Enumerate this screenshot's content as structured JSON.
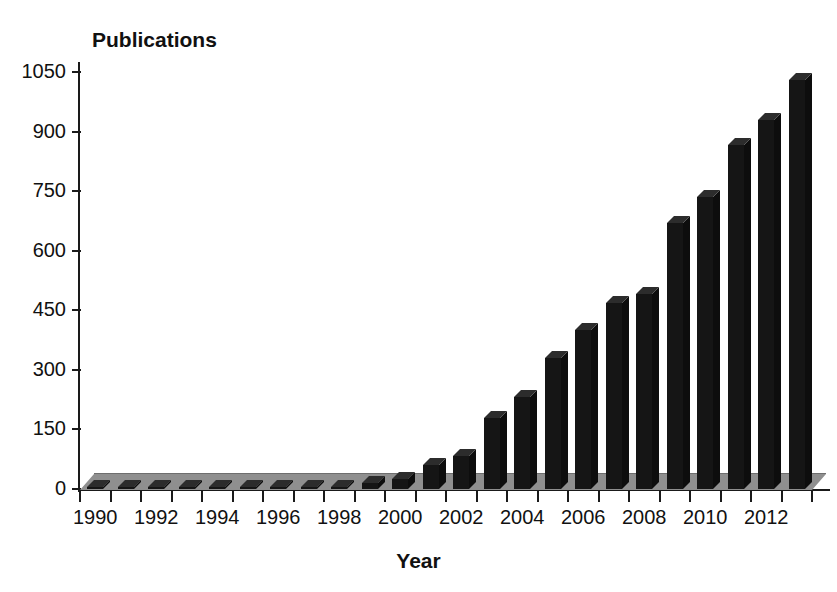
{
  "chart_data": {
    "type": "bar",
    "title": "",
    "xlabel": "Year",
    "ylabel": "Publications",
    "ylim": [
      0,
      1100
    ],
    "yticks": [
      0,
      150,
      300,
      450,
      600,
      750,
      900,
      1050
    ],
    "xtick_labels": [
      "1990",
      "1992",
      "1994",
      "1996",
      "1998",
      "2000",
      "2002",
      "2004",
      "2006",
      "2008",
      "2010",
      "2012"
    ],
    "grid": false,
    "legend": null,
    "bar_color": "#151515",
    "floor_color": "#8f8f8f",
    "categories": [
      "1990",
      "1991",
      "1992",
      "1993",
      "1994",
      "1995",
      "1996",
      "1997",
      "1998",
      "1999",
      "2000",
      "2001",
      "2002",
      "2003",
      "2004",
      "2005",
      "2006",
      "2007",
      "2008",
      "2009",
      "2010",
      "2011",
      "2012",
      "2013"
    ],
    "values": [
      1,
      1,
      1,
      1,
      1,
      2,
      1,
      1,
      3,
      15,
      25,
      60,
      82,
      180,
      232,
      330,
      400,
      468,
      492,
      670,
      735,
      865,
      930,
      1030
    ]
  },
  "axis": {
    "y_title": "Publications",
    "x_title": "Year"
  }
}
